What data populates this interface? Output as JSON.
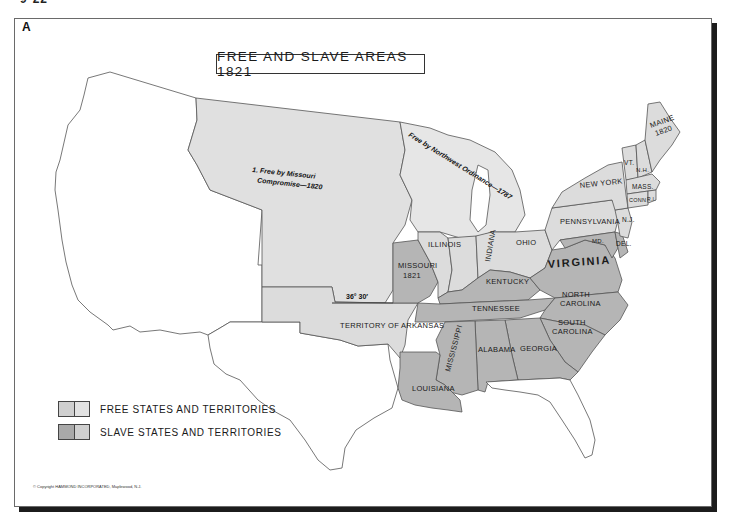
{
  "page_tag": "9-22",
  "plate_letter": "A",
  "title": "FREE AND SLAVE AREAS 1821",
  "colors": {
    "free": "#dcdcdc",
    "slave": "#b5b5b5",
    "free_territory": "#e0e0e0",
    "unorganized": "#ffffff",
    "border": "#555555",
    "frame_shadow": "#1c1c1c"
  },
  "annotations": {
    "missouri_compromise": [
      "1. Free by Missouri",
      "Compromise—1820"
    ],
    "northwest_ordinance": "Free by Northwest Ordinance—1787",
    "parallel": "36° 30′"
  },
  "regions": {
    "territory_of_arkansas": "TERRITORY OF ARKANSAS",
    "missouri": [
      "MISSOURI",
      "1821"
    ],
    "illinois": "ILLINOIS",
    "indiana": "INDIANA",
    "ohio": "OHIO",
    "kentucky": "KENTUCKY",
    "tennessee": "TENNESSEE",
    "virginia": "VIRGINIA",
    "north_carolina": [
      "NORTH",
      "CAROLINA"
    ],
    "south_carolina": [
      "SOUTH",
      "CAROLINA"
    ],
    "georgia": "GEORGIA",
    "alabama": "ALABAMA",
    "mississippi": "MISSISSIPPI",
    "louisiana": "LOUISIANA",
    "pennsylvania": "PENNSYLVANIA",
    "new_york": "NEW YORK",
    "maryland": "MD.",
    "delaware": "DEL.",
    "new_jersey": "N.J.",
    "connecticut": "CONN.",
    "rhode_island": "R.I.",
    "massachusetts": "MASS.",
    "vermont": "VT.",
    "new_hampshire": "N.H.",
    "maine": [
      "MAINE",
      "1820"
    ]
  },
  "legend": {
    "items": [
      {
        "label": "FREE STATES AND TERRITORIES",
        "left": "#cfcfcf",
        "right": "#e2e2e2"
      },
      {
        "label": "SLAVE STATES AND TERRITORIES",
        "left": "#a9a9a9",
        "right": "#cfcfcf"
      }
    ]
  },
  "copyright": "© Copyright HAMMOND INCORPORATED, Maplewood, N.J."
}
